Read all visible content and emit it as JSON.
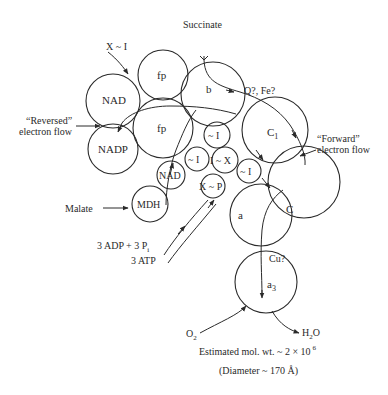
{
  "diagram": {
    "components": {
      "fp_top": "fp",
      "nad_left": "NAD",
      "nadp": "NADP",
      "fp_main": "fp",
      "b": "b",
      "c1": "C",
      "c1_sub": "1",
      "i_upper": "~ I",
      "i_left": "~ I",
      "i_x": "I ~ X",
      "i_right": "~ I",
      "nad_small": "NAD",
      "mdh": "MDH",
      "x_p": "X ~ P",
      "c": "C",
      "a": "a",
      "a3": "a",
      "a3_sub": "3"
    },
    "labels": {
      "succinate": "Succinate",
      "x_i": "X ~ I",
      "q_fe": "Q?, Fe?",
      "reversed_line1": "“Reversed”",
      "reversed_line2": "electron flow",
      "forward_line1": "“Forward”",
      "forward_line2": "electron flow",
      "malate": "Malate",
      "adp": "3 ADP + 3 P",
      "adp_sub": "i",
      "atp": "3 ATP",
      "cu": "Cu?",
      "o2": "O",
      "o2_sub": "2",
      "h2o_h": "H",
      "h2o_sub": "2",
      "h2o_o": "O",
      "mol_wt": "Estimated mol. wt. ~ 2 × 10",
      "mol_wt_exp": "6",
      "diameter": "(Diameter ~ 170 Å)"
    }
  }
}
